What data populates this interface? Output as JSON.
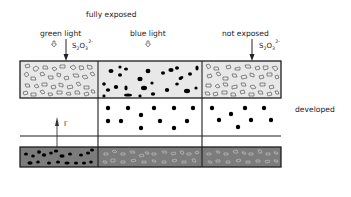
{
  "diagram": {
    "title": "fully exposed",
    "columns": [
      {
        "label": "green light",
        "reagent": "S2O3 2-"
      },
      {
        "label": "blue light",
        "reagent": ""
      },
      {
        "label": "not exposed",
        "reagent": "S2O3 2-"
      }
    ],
    "reagent_label": {
      "base": "S",
      "sub1": "2",
      "mid": "O",
      "sub2": "3",
      "sup": "2-"
    },
    "developed_label": "developed",
    "iodide_label": {
      "base": "I",
      "sup": "-"
    },
    "colors": {
      "light_fill": "#e8e8e8",
      "dark_fill": "#7c7c7c",
      "border": "#1e1e1e",
      "grain_solid": "#000000"
    },
    "layers": [
      {
        "name": "top-emulsion",
        "grains": [
          "hollow",
          "solid",
          "hollow"
        ]
      },
      {
        "name": "developed-layer",
        "grains": [
          "none",
          "dots",
          "dots"
        ]
      },
      {
        "name": "bottom-emulsion",
        "grains": [
          "solid",
          "hollow",
          "hollow"
        ]
      }
    ]
  }
}
